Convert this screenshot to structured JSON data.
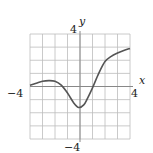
{
  "chart_data": {
    "type": "line",
    "title": "",
    "xlabel": "x",
    "ylabel": "y",
    "xlim": [
      -4,
      4
    ],
    "ylim": [
      -4,
      4
    ],
    "grid": true,
    "grid_step": 1,
    "tick_labels": {
      "x_min": "−4",
      "x_max": "4",
      "y_min": "−4",
      "y_max": "4"
    },
    "series": [
      {
        "name": "f(x)",
        "x": [
          -4,
          -3.5,
          -3,
          -2.5,
          -2,
          -1.5,
          -1,
          -0.5,
          -0.1,
          0.3,
          0.6,
          1,
          1.5,
          2,
          2.5,
          3,
          3.5,
          4
        ],
        "y": [
          0.1,
          0.25,
          0.4,
          0.45,
          0.4,
          0.1,
          -0.5,
          -1.25,
          -1.6,
          -1.4,
          -0.9,
          -0.1,
          1.0,
          1.9,
          2.3,
          2.55,
          2.75,
          2.9
        ]
      }
    ]
  },
  "labels": {
    "x_axis": "x",
    "y_axis": "y",
    "x_min": "−4",
    "x_max": "4",
    "y_min": "−4",
    "y_max": "4"
  },
  "colors": {
    "grid": "#bdbdbd",
    "axis": "#888888",
    "curve": "#555555"
  }
}
